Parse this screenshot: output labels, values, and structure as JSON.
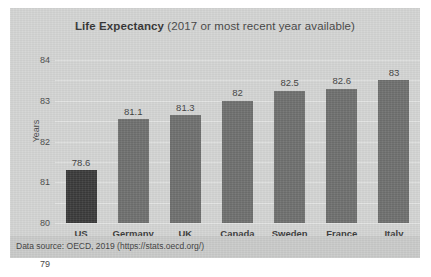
{
  "chart_data": {
    "type": "bar",
    "title": "Life Expectancy (2017 or most recent year available)",
    "title_strong": "Life Expectancy",
    "title_rest": " (2017 or most recent year available)",
    "categories": [
      "US",
      "Germany",
      "UK",
      "Canada",
      "Sweden",
      "France",
      "Italy"
    ],
    "values": [
      78.6,
      81.1,
      81.3,
      82,
      82.5,
      82.6,
      83
    ],
    "value_labels": [
      "78.6",
      "81.1",
      "81.3",
      "82",
      "82.5",
      "82.6",
      "83"
    ],
    "xlabel": "",
    "ylabel": "Years",
    "ylim": [
      76,
      84
    ],
    "yticks": [
      84,
      83,
      82,
      81,
      80,
      79,
      78,
      77,
      76
    ],
    "ytick_labels": [
      "84",
      "83",
      "82",
      "81",
      "80",
      "79",
      "78",
      "77",
      "76"
    ],
    "grid": true,
    "legend": false,
    "highlight_category": "US",
    "bar_color": "#6e6f6e",
    "highlight_color": "#3a3a3a",
    "panel_color": "#d3d4d3",
    "gridline_color": "#e2e3e2",
    "source_note": "Data source: OECD, 2019 (https://stats.oecd.org/)"
  }
}
